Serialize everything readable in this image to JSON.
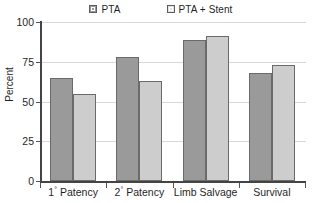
{
  "chart_data": {
    "type": "bar",
    "title": "",
    "xlabel": "",
    "ylabel": "Percent",
    "ylim": [
      0,
      100
    ],
    "yticks": [
      0,
      25,
      50,
      75,
      100
    ],
    "grid": true,
    "legend_position": "top-center",
    "categories": [
      "1° Patency",
      "2° Patency",
      "Limb Salvage",
      "Survival"
    ],
    "category_parts": [
      {
        "prefix": "1",
        "sup": "°",
        "suffix": " Patency"
      },
      {
        "prefix": "2",
        "sup": "°",
        "suffix": " Patency"
      },
      {
        "prefix": "Limb Salvage",
        "sup": "",
        "suffix": ""
      },
      {
        "prefix": "Survival",
        "sup": "",
        "suffix": ""
      }
    ],
    "series": [
      {
        "name": "PTA",
        "color": "#9a9a9a",
        "values": [
          65,
          78,
          89,
          68
        ]
      },
      {
        "name": "PTA + Stent",
        "color": "#cdcdcd",
        "values": [
          55,
          63,
          91,
          73
        ]
      }
    ]
  },
  "legend": {
    "entries": [
      {
        "label": "PTA",
        "swatch": "dark-gray-swatch-icon"
      },
      {
        "label": "PTA + Stent",
        "swatch": "light-gray-swatch-icon"
      }
    ]
  },
  "axis": {
    "y_title": "Percent",
    "y_tick_labels": [
      "100",
      "75",
      "50",
      "25",
      "0"
    ]
  }
}
